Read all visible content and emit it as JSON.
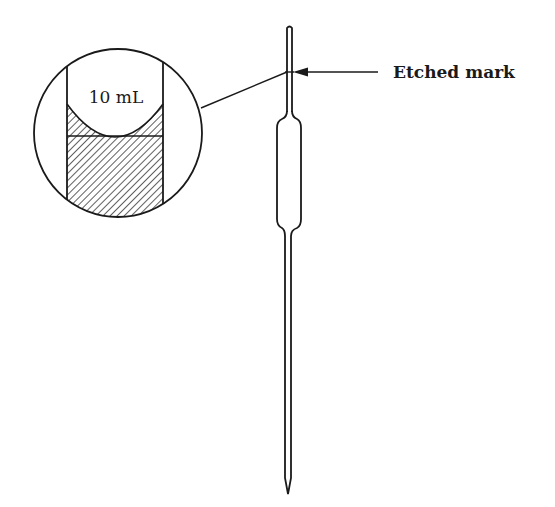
{
  "diagram": {
    "magnified_view": {
      "volume_label": "10 mL"
    },
    "callout": {
      "label": "Etched mark"
    },
    "colors": {
      "stroke": "#1a1a1a",
      "background": "#ffffff"
    }
  }
}
